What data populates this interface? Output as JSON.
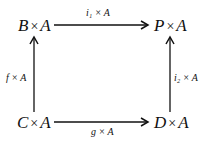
{
  "diagram": {
    "type": "commutative-square",
    "nodes": {
      "top_left": {
        "obj": "B",
        "op": "×",
        "factor": "A"
      },
      "top_right": {
        "obj": "P",
        "op": "×",
        "factor": "A"
      },
      "bottom_left": {
        "obj": "C",
        "op": "×",
        "factor": "A"
      },
      "bottom_right": {
        "obj": "D",
        "op": "×",
        "factor": "A"
      }
    },
    "arrows": {
      "top": {
        "from": "B × A",
        "to": "P × A",
        "label": "i₁ × A"
      },
      "bottom": {
        "from": "C × A",
        "to": "D × A",
        "label": "g × A"
      },
      "left": {
        "from": "C × A",
        "to": "B × A",
        "label": "f × A"
      },
      "right": {
        "from": "D × A",
        "to": "P × A",
        "label": "i₂ × A"
      }
    }
  }
}
